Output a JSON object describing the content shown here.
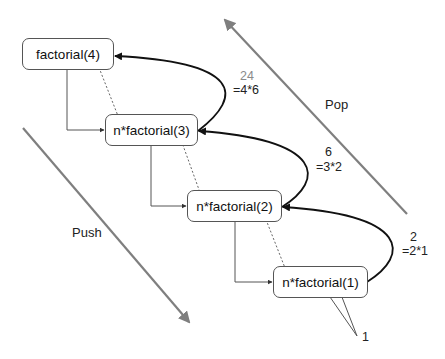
{
  "diagram": {
    "nodes": [
      {
        "id": "f4",
        "label": "factorial(4)"
      },
      {
        "id": "f3",
        "label": "n*factorial(3)"
      },
      {
        "id": "f2",
        "label": "n*factorial(2)"
      },
      {
        "id": "f1",
        "label": "n*factorial(1)"
      }
    ],
    "returns": [
      {
        "value": "24",
        "expr": "=4*6"
      },
      {
        "value": "6",
        "expr": "=3*2"
      },
      {
        "value": "2",
        "expr": "=2*1"
      }
    ],
    "base_case": {
      "value": "1"
    },
    "directions": {
      "pop": "Pop",
      "push": "Push"
    },
    "colors": {
      "arrow_gray": "#7f7f7f",
      "line_dark": "#111111",
      "box_border": "#555555",
      "highlight_value": "#8a8a8a"
    }
  }
}
